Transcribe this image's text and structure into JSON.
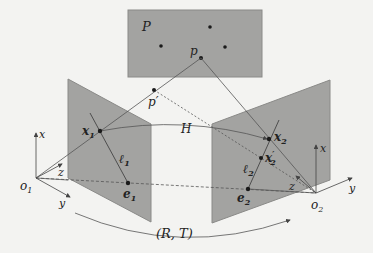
{
  "figure": {
    "type": "epipolar-geometry-diagram",
    "colors": {
      "background": "#f3f3f1",
      "plane_fill": "#a3a3a1",
      "plane_edge": "#8a8a88",
      "line": "#555555",
      "point": "#1a1a1a",
      "text": "#222222"
    },
    "labels": {
      "scene_plane": "P",
      "scene_point": "p",
      "scene_point_prime": "p′",
      "homography": "H",
      "x1": "x",
      "x1_sub": "1",
      "x2": "x",
      "x2_sub": "2",
      "x2p": "x",
      "x2p_sub": "2",
      "x2p_sup": "′",
      "l1": "ℓ",
      "l1_sub": "1",
      "l2": "ℓ",
      "l2_sub": "2",
      "e1": "e",
      "e1_sub": "1",
      "e2": "e",
      "e2_sub": "2",
      "o1": "o",
      "o1_sub": "1",
      "o2": "o",
      "o2_sub": "2",
      "axis_x1": "x",
      "axis_y1": "y",
      "axis_z1": "z",
      "axis_x2": "x",
      "axis_y2": "y",
      "axis_z2": "z",
      "motion": "(R, T)"
    }
  }
}
